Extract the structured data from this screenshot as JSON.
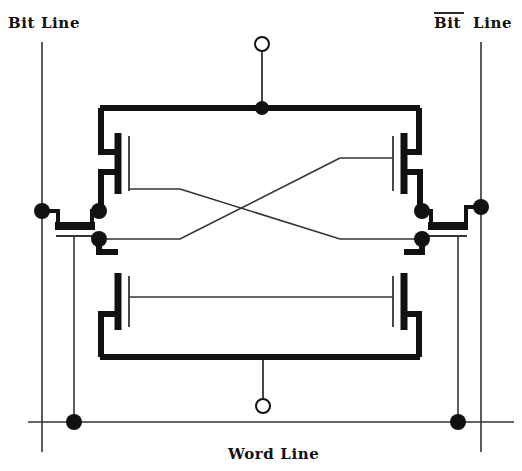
{
  "diagram": {
    "kind": "schematic",
    "background_color": "#ffffff",
    "ink_color": "#111111",
    "thin_line_color": "#333333"
  },
  "labels": {
    "bit_line_left": {
      "text": "Bit  Line",
      "overbar": false,
      "x": 8,
      "y": 28
    },
    "bit_line_right": {
      "text": "Line",
      "overbar_text": "Bit",
      "overbar": true,
      "x": 434,
      "y": 28
    },
    "word_line": {
      "text": "Word  Line",
      "overbar": false,
      "x": 228,
      "y": 459
    }
  },
  "terminals": {
    "supply_top": {
      "name": "vdd-terminal",
      "symbol": "open-circle",
      "cx": 262,
      "cy": 44,
      "r": 7
    },
    "ground_bottom": {
      "name": "gnd-terminal",
      "symbol": "open-circle",
      "cx": 263,
      "cy": 406,
      "r": 7
    }
  },
  "rails": {
    "top_rail": {
      "x1": 100,
      "x2": 420,
      "y": 108
    },
    "bottom_rail": {
      "x1": 100,
      "x2": 420,
      "y": 357
    },
    "word_line": {
      "x1": 28,
      "x2": 514,
      "y": 422
    },
    "bit_line_left": {
      "x": 42,
      "y1": 42,
      "y2": 452
    },
    "bit_line_right": {
      "x": 481,
      "y1": 42,
      "y2": 452
    }
  },
  "nodes": [
    {
      "name": "vdd-rail-node",
      "cx": 262,
      "cy": 108,
      "r": 7
    },
    {
      "name": "left-bitline-node",
      "cx": 42,
      "cy": 211,
      "r": 8
    },
    {
      "name": "left-storage-upper-node",
      "cx": 99,
      "cy": 211,
      "r": 8
    },
    {
      "name": "left-storage-lower-node",
      "cx": 99,
      "cy": 239,
      "r": 8
    },
    {
      "name": "right-storage-upper-node",
      "cx": 422,
      "cy": 211,
      "r": 8
    },
    {
      "name": "right-storage-lower-node",
      "cx": 422,
      "cy": 239,
      "r": 8
    },
    {
      "name": "right-bitline-node",
      "cx": 481,
      "cy": 207,
      "r": 8
    },
    {
      "name": "left-wordline-node",
      "cx": 74,
      "cy": 422,
      "r": 8
    },
    {
      "name": "right-wordline-node",
      "cx": 458,
      "cy": 422,
      "r": 8
    }
  ],
  "transistors": [
    {
      "name": "pull-up-left",
      "role": "load",
      "channel_x": 118,
      "channel_y1": 133,
      "channel_y2": 194,
      "gate_x": 128
    },
    {
      "name": "pull-up-right",
      "role": "load",
      "channel_x": 404,
      "channel_y1": 133,
      "channel_y2": 194,
      "gate_x": 394
    },
    {
      "name": "pull-down-left",
      "role": "driver",
      "channel_x": 118,
      "channel_y1": 273,
      "channel_y2": 330,
      "gate_x": 128
    },
    {
      "name": "pull-down-right",
      "role": "driver",
      "channel_x": 404,
      "channel_y1": 273,
      "channel_y2": 330,
      "gate_x": 394
    },
    {
      "name": "access-left",
      "role": "pass-gate",
      "channel_y": 226,
      "channel_x1": 58,
      "channel_x2": 92,
      "gate_y": 236
    },
    {
      "name": "access-right",
      "role": "pass-gate",
      "channel_y": 226,
      "channel_x1": 432,
      "channel_x2": 466,
      "gate_y": 236
    }
  ],
  "cross_coupling": [
    {
      "name": "cross-link-upper",
      "points": "143,189 180,189 340,239 422,239"
    },
    {
      "name": "cross-link-lower",
      "points": "143,239 180,239 340,158 400,158"
    }
  ]
}
